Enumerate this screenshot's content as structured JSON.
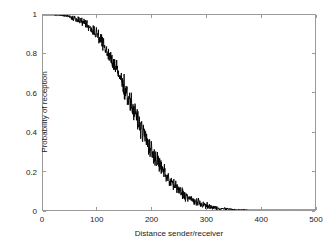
{
  "chart_data": {
    "type": "line",
    "title": "",
    "subtitle": "",
    "xlabel": "Distance sender/receiver",
    "ylabel": "Probability of reception",
    "xlim": [
      0,
      500
    ],
    "ylim": [
      0,
      1
    ],
    "xticks": [
      0,
      100,
      200,
      300,
      400,
      500
    ],
    "yticks": [
      0,
      0.2,
      0.4,
      0.6,
      0.8,
      1
    ],
    "xtick_labels": [
      "0",
      "100",
      "200",
      "300",
      "400",
      "500"
    ],
    "ytick_labels": [
      "0",
      "0.2",
      "0.4",
      "0.6",
      "0.8",
      "1"
    ],
    "grid": false,
    "legend": null,
    "legend_position": "none",
    "annotations": [],
    "series": [
      {
        "name": "Probability of reception",
        "color": "#000000",
        "line_width": 0.9,
        "noise_amplitude": 0.022,
        "description": "Noisy sigmoid / logistic decay from 1 near distance 0 to 0 beyond distance 350",
        "x": [
          0,
          10,
          20,
          30,
          40,
          50,
          60,
          70,
          80,
          90,
          100,
          110,
          120,
          130,
          140,
          150,
          160,
          170,
          180,
          190,
          200,
          210,
          220,
          230,
          240,
          250,
          260,
          270,
          280,
          290,
          300,
          310,
          320,
          330,
          340,
          350,
          360,
          370,
          380,
          390,
          400,
          420,
          440,
          460,
          480,
          500
        ],
        "y": [
          1.0,
          1.0,
          1.0,
          0.999,
          0.997,
          0.99,
          0.981,
          0.968,
          0.95,
          0.925,
          0.893,
          0.853,
          0.805,
          0.75,
          0.69,
          0.625,
          0.558,
          0.49,
          0.423,
          0.36,
          0.3,
          0.248,
          0.202,
          0.162,
          0.128,
          0.1,
          0.077,
          0.058,
          0.043,
          0.031,
          0.022,
          0.015,
          0.01,
          0.006,
          0.004,
          0.002,
          0.001,
          0.001,
          0.0,
          0.0,
          0.0,
          0.0,
          0.0,
          0.0,
          0.0,
          0.0
        ]
      }
    ]
  },
  "axes": {
    "box_color": "#9a9a9a",
    "tick_color": "#9a9a9a",
    "text_color": "#1a1a1a",
    "background": "#ffffff"
  }
}
